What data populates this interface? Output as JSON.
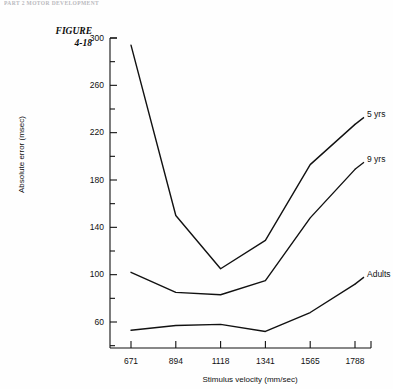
{
  "running_head": "PART 2  MOTOR DEVELOPMENT",
  "figure_label": {
    "line1": "FIGURE",
    "line2": "4-18"
  },
  "colors": {
    "background": "#fefefe",
    "line": "#111111",
    "axis": "#111111",
    "running_head": "#b9b9bd"
  },
  "chart_data": {
    "type": "line",
    "title": "",
    "xlabel": "Stimulus velocity  (mm/sec)",
    "ylabel": "Absolute error (msec)",
    "categories": [
      "671",
      "894",
      "1118",
      "1341",
      "1565",
      "1788"
    ],
    "x": [
      671,
      894,
      1118,
      1341,
      1565,
      1788
    ],
    "xtick_labels": [
      "671",
      "894",
      "1118",
      "1341",
      "1565",
      "1788"
    ],
    "ytick_labels": [
      "300",
      "260",
      "220",
      "180",
      "140",
      "100",
      "60"
    ],
    "yticks": [
      300,
      260,
      220,
      180,
      140,
      100,
      60
    ],
    "yminor_step": 20,
    "ylim": [
      40,
      300
    ],
    "grid": false,
    "legend_position": "right-inline",
    "series": [
      {
        "name": "5 yrs",
        "values": [
          294,
          150,
          105,
          129,
          193,
          227
        ]
      },
      {
        "name": "9 yrs",
        "values": [
          102,
          85,
          83,
          95,
          148,
          189
        ]
      },
      {
        "name": "Adults",
        "values": [
          53,
          57,
          58,
          52,
          68,
          92
        ]
      }
    ]
  }
}
